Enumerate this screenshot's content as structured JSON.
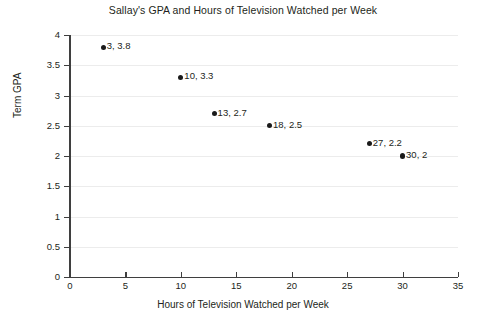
{
  "chart_data": {
    "type": "scatter",
    "title": "Sallay's GPA and Hours of Television Watched per Week",
    "xlabel": "Hours of Television Watched per Week",
    "ylabel": "Term GPA",
    "xlim": [
      0,
      35
    ],
    "ylim": [
      0,
      4
    ],
    "xticks": [
      "0",
      "5",
      "10",
      "15",
      "20",
      "25",
      "30",
      "35"
    ],
    "xtick_values": [
      0,
      5,
      10,
      15,
      20,
      25,
      30,
      35
    ],
    "yticks": [
      "0",
      "0.5",
      "1",
      "1.5",
      "2",
      "2.5",
      "3",
      "3.5",
      "4"
    ],
    "ytick_values": [
      0,
      0.5,
      1,
      1.5,
      2,
      2.5,
      3,
      3.5,
      4
    ],
    "grid": "horizontal",
    "legend": "none",
    "marker_color": "#1a1a1a",
    "gridline_color": "#ececec",
    "axis_color": "#3f3f3f",
    "background_color": "#ffffff",
    "points": [
      {
        "x": 3,
        "y": 3.8,
        "label": "3, 3.8"
      },
      {
        "x": 10,
        "y": 3.3,
        "label": "10, 3.3"
      },
      {
        "x": 13,
        "y": 2.7,
        "label": "13, 2.7"
      },
      {
        "x": 18,
        "y": 2.5,
        "label": "18, 2.5"
      },
      {
        "x": 27,
        "y": 2.2,
        "label": "27, 2.2"
      },
      {
        "x": 30,
        "y": 2,
        "label": "30, 2"
      }
    ]
  }
}
